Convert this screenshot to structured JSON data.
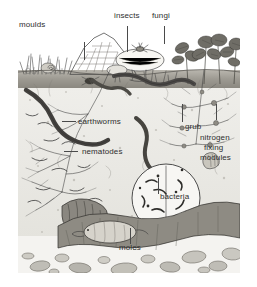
{
  "figure": {
    "kind": "soil-ecology-cross-section-illustration",
    "style": "grayscale pen-and-ink drawing",
    "background_color": "#ffffff",
    "frame_color": "#f3f2ef"
  },
  "labels": {
    "moulds": "moulds",
    "insects": "insects",
    "fungi": "fungi",
    "earthworms": "earthworms",
    "grub": "grub",
    "nitrogen": "nitrogen",
    "fixing": "fixing",
    "modules": "modules",
    "nematodes": "nematodes",
    "bacteria": "bacteria",
    "moles": "moles"
  },
  "scene": {
    "layers": [
      {
        "name": "above-ground vegetation",
        "color": "#ffffff"
      },
      {
        "name": "topsoil",
        "color": "#9d9a92"
      },
      {
        "name": "subsoil",
        "color": "#e9e8e3"
      },
      {
        "name": "stony-layer",
        "color": "#f4f3f0"
      }
    ],
    "organisms": [
      "moulds",
      "insects",
      "fungi",
      "earthworms",
      "grub",
      "nematodes",
      "bacteria",
      "moles",
      "nitrogen fixing modules"
    ]
  },
  "colors": {
    "ink": "#3a3a3a",
    "text": "#2e2e2e",
    "topsoil": "#9d9a92",
    "subsoil": "#e9e8e3",
    "stone": "#b9b7b0"
  }
}
